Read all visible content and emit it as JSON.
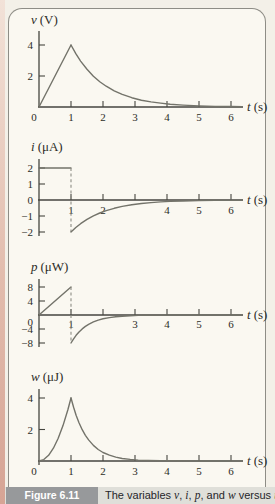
{
  "figure": {
    "caption_label": "Figure 6.11",
    "caption_parts": [
      "The variables ",
      "v",
      ", ",
      "i",
      ", ",
      "p",
      ", and ",
      "w",
      " versus ",
      "t"
    ]
  },
  "colors": {
    "page_bg": "#f3f0e8",
    "panel_bg": "#faf8f1",
    "panel_border": "#8e8d86",
    "axis": "#45453f",
    "curve": "#73736a",
    "caption_badge_bg": "#97999b",
    "caption_band_bg": "#dfdfd9",
    "page_edge_strip": "#e2bcad"
  },
  "chart_data": {
    "type": "line",
    "title": "Figure 6.11  The variables v, i, p, and w versus t",
    "xlabel": "t (s)",
    "x_range": [
      0,
      6.3
    ],
    "grid": false,
    "legend": "none",
    "charts": [
      {
        "name": "voltage",
        "ylabel_var": "v",
        "ylabel_unit": "(V)",
        "xlabel_var": "t",
        "xlabel_unit": "(s)",
        "ylim": [
          0,
          5
        ],
        "xticks": [
          1,
          2,
          3,
          4,
          5,
          6
        ],
        "xtick_labels": [
          {
            "t": 0,
            "label": "0"
          },
          {
            "t": 1,
            "label": "1"
          },
          {
            "t": 2,
            "label": "2"
          },
          {
            "t": 3,
            "label": "3"
          },
          {
            "t": 4,
            "label": "4"
          },
          {
            "t": 5,
            "label": "5"
          },
          {
            "t": 6,
            "label": "6"
          }
        ],
        "yticks": [
          {
            "v": 2,
            "label": "2"
          },
          {
            "v": 4,
            "label": "4"
          }
        ],
        "segments": [
          {
            "style": "solid",
            "pts": [
              [
                0,
                0
              ],
              [
                1,
                4
              ]
            ]
          },
          {
            "style": "solid",
            "pts": [
              [
                1,
                4
              ],
              [
                1.15,
                3.44
              ],
              [
                1.3,
                2.96
              ],
              [
                1.5,
                2.43
              ],
              [
                1.7,
                1.99
              ],
              [
                1.9,
                1.63
              ],
              [
                2.1,
                1.34
              ],
              [
                2.35,
                1.04
              ],
              [
                2.6,
                0.81
              ],
              [
                2.9,
                0.6
              ],
              [
                3.2,
                0.44
              ],
              [
                3.5,
                0.33
              ],
              [
                3.8,
                0.25
              ],
              [
                4.1,
                0.18
              ],
              [
                4.5,
                0.12
              ],
              [
                5,
                0.07
              ],
              [
                5.5,
                0.04
              ],
              [
                6,
                0.03
              ],
              [
                6.35,
                0.02
              ]
            ]
          }
        ]
      },
      {
        "name": "current",
        "ylabel_var": "i",
        "ylabel_unit": "(μA)",
        "xlabel_var": "t",
        "xlabel_unit": "(s)",
        "ylim": [
          -2.5,
          2.5
        ],
        "xticks": [
          1,
          2,
          3,
          4,
          5,
          6
        ],
        "xtick_labels": [
          {
            "t": 1,
            "label": "1"
          },
          {
            "t": 2,
            "label": "2"
          },
          {
            "t": 4,
            "label": "4"
          },
          {
            "t": 5,
            "label": "5"
          },
          {
            "t": 6,
            "label": "6"
          }
        ],
        "yticks": [
          {
            "v": 2,
            "label": "2"
          },
          {
            "v": 1,
            "label": "1"
          },
          {
            "v": 0,
            "label": "0"
          },
          {
            "v": -1,
            "label": "−1"
          },
          {
            "v": -2,
            "label": "−2"
          }
        ],
        "segments": [
          {
            "style": "solid",
            "pts": [
              [
                0,
                2
              ],
              [
                1,
                2
              ]
            ]
          },
          {
            "style": "dashed",
            "pts": [
              [
                1,
                2
              ],
              [
                1,
                -2
              ]
            ]
          },
          {
            "style": "solid",
            "pts": [
              [
                1,
                -2
              ],
              [
                1.15,
                -1.72
              ],
              [
                1.3,
                -1.48
              ],
              [
                1.5,
                -1.21
              ],
              [
                1.7,
                -0.99
              ],
              [
                1.9,
                -0.81
              ],
              [
                2.1,
                -0.67
              ],
              [
                2.35,
                -0.52
              ],
              [
                2.6,
                -0.4
              ],
              [
                2.9,
                -0.3
              ],
              [
                3.2,
                -0.22
              ],
              [
                3.5,
                -0.16
              ],
              [
                3.8,
                -0.12
              ],
              [
                4.1,
                -0.09
              ],
              [
                4.5,
                -0.06
              ],
              [
                5,
                -0.04
              ],
              [
                5.5,
                -0.02
              ],
              [
                6,
                -0.01
              ],
              [
                6.35,
                -0.01
              ]
            ]
          }
        ]
      },
      {
        "name": "power",
        "ylabel_var": "p",
        "ylabel_unit": "(μW)",
        "xlabel_var": "t",
        "xlabel_unit": "(s)",
        "ylim": [
          -10,
          10
        ],
        "xticks": [
          1,
          2,
          3,
          4,
          5,
          6
        ],
        "xtick_labels": [
          {
            "t": 1,
            "label": "1"
          },
          {
            "t": 3,
            "label": "3"
          },
          {
            "t": 4,
            "label": "4"
          },
          {
            "t": 5,
            "label": "5"
          },
          {
            "t": 6,
            "label": "6"
          }
        ],
        "yticks": [
          {
            "v": 8,
            "label": "8"
          },
          {
            "v": 4,
            "label": "4"
          },
          {
            "v": 0,
            "label": "0",
            "dy": 7
          },
          {
            "v": -4,
            "label": "−4"
          },
          {
            "v": -8,
            "label": "−8"
          }
        ],
        "segments": [
          {
            "style": "solid",
            "pts": [
              [
                0,
                0
              ],
              [
                1,
                8
              ]
            ]
          },
          {
            "style": "dashed",
            "pts": [
              [
                1,
                8
              ],
              [
                1,
                -8
              ]
            ]
          },
          {
            "style": "solid",
            "pts": [
              [
                1,
                -8
              ],
              [
                1.08,
                -6.81
              ],
              [
                1.16,
                -5.81
              ],
              [
                1.25,
                -4.85
              ],
              [
                1.35,
                -3.98
              ],
              [
                1.45,
                -3.26
              ],
              [
                1.55,
                -2.67
              ],
              [
                1.7,
                -1.98
              ],
              [
                1.85,
                -1.46
              ],
              [
                2,
                -1.08
              ],
              [
                2.2,
                -0.73
              ],
              [
                2.4,
                -0.49
              ],
              [
                2.6,
                -0.33
              ],
              [
                2.85,
                -0.2
              ],
              [
                3.1,
                -0.12
              ],
              [
                3.4,
                -0.07
              ],
              [
                3.8,
                -0.03
              ],
              [
                4.2,
                -0.01
              ],
              [
                4.8,
                0
              ],
              [
                6.35,
                0
              ]
            ]
          }
        ]
      },
      {
        "name": "energy",
        "ylabel_var": "w",
        "ylabel_unit": "(μJ)",
        "xlabel_var": "t",
        "xlabel_unit": "(s)",
        "ylim": [
          0,
          5
        ],
        "xticks": [
          1,
          2,
          3,
          4,
          5,
          6
        ],
        "xtick_labels": [
          {
            "t": 0,
            "label": "0"
          },
          {
            "t": 1,
            "label": "1"
          },
          {
            "t": 2,
            "label": "2"
          },
          {
            "t": 3,
            "label": "3"
          },
          {
            "t": 4,
            "label": "4"
          },
          {
            "t": 5,
            "label": "5"
          },
          {
            "t": 6,
            "label": "6"
          }
        ],
        "yticks": [
          {
            "v": 2,
            "label": "2"
          },
          {
            "v": 4,
            "label": "4"
          }
        ],
        "segments": [
          {
            "style": "solid",
            "pts": [
              [
                0,
                0
              ],
              [
                0.15,
                0.09
              ],
              [
                0.3,
                0.36
              ],
              [
                0.45,
                0.81
              ],
              [
                0.6,
                1.44
              ],
              [
                0.75,
                2.25
              ],
              [
                0.9,
                3.24
              ],
              [
                1,
                4
              ]
            ]
          },
          {
            "style": "solid",
            "pts": [
              [
                1,
                4
              ],
              [
                1.08,
                3.41
              ],
              [
                1.16,
                2.91
              ],
              [
                1.25,
                2.43
              ],
              [
                1.35,
                1.99
              ],
              [
                1.45,
                1.63
              ],
              [
                1.55,
                1.34
              ],
              [
                1.7,
                0.99
              ],
              [
                1.85,
                0.73
              ],
              [
                2,
                0.54
              ],
              [
                2.2,
                0.37
              ],
              [
                2.4,
                0.25
              ],
              [
                2.6,
                0.16
              ],
              [
                2.85,
                0.1
              ],
              [
                3.1,
                0.06
              ],
              [
                3.4,
                0.04
              ],
              [
                3.8,
                0.02
              ],
              [
                4.2,
                0.01
              ],
              [
                4.8,
                0
              ],
              [
                6.35,
                0
              ]
            ]
          }
        ]
      }
    ]
  }
}
